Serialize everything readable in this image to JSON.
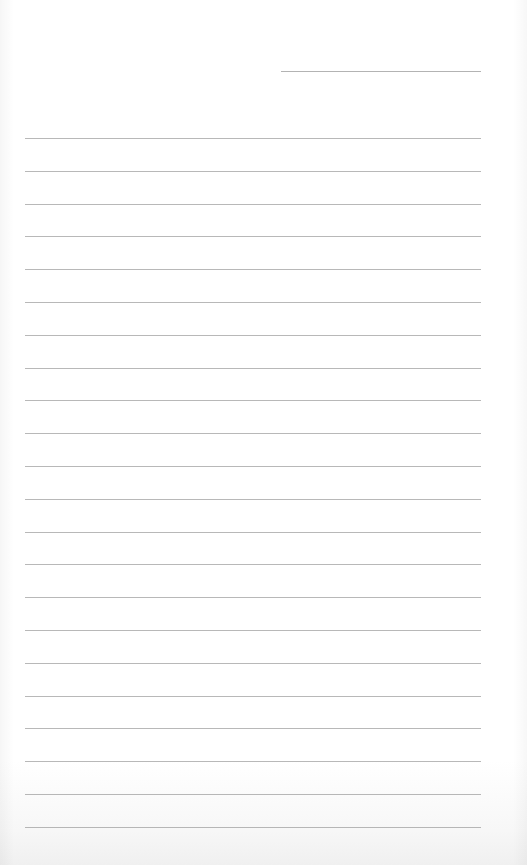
{
  "page": {
    "type": "lined-paper",
    "background_color": "#ffffff",
    "rule_color": "#9a9a9a"
  },
  "header_line": {
    "x": 281,
    "y": 71,
    "width": 200
  },
  "rules": {
    "count": 22,
    "x": 25,
    "width": 456,
    "first_y": 138,
    "spacing": 32.8
  }
}
